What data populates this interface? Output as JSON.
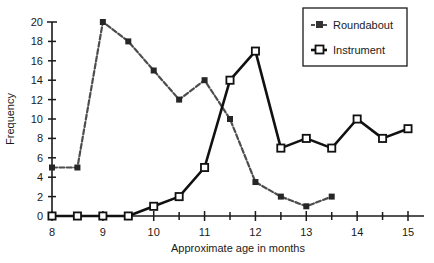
{
  "chart_data": {
    "type": "line",
    "title": "",
    "subtitle": "",
    "xlabel": "Approximate age in months",
    "ylabel": "Frequency",
    "xlim": [
      8,
      15
    ],
    "ylim": [
      0,
      20
    ],
    "x_tick_step": 1,
    "x_minor_tick_step": 0.5,
    "y_tick_step": 2,
    "grid": false,
    "legend_position": "top-right",
    "x_tick_labels": [
      "8",
      "9",
      "10",
      "11",
      "12",
      "13",
      "14",
      "15"
    ],
    "y_tick_labels": [
      "0",
      "2",
      "4",
      "6",
      "8",
      "10",
      "12",
      "14",
      "16",
      "18",
      "20"
    ],
    "x": [
      8,
      8.5,
      9,
      9.5,
      10,
      10.5,
      11,
      11.5,
      12,
      12.5,
      13,
      13.5,
      14,
      14.5,
      15
    ],
    "series": [
      {
        "name": "Roundabout",
        "marker": "filled-square",
        "color": "#4d4d4d",
        "x": [
          8,
          8.5,
          9,
          9.5,
          10,
          10.5,
          11,
          11.5,
          12,
          12.5,
          13,
          13.5
        ],
        "values": [
          5,
          5,
          20,
          18,
          15,
          12,
          14,
          10,
          3.5,
          2,
          1,
          2
        ]
      },
      {
        "name": "Instrument",
        "marker": "open-square",
        "color": "#111111",
        "x": [
          8,
          8.5,
          9,
          9.5,
          10,
          10.5,
          11,
          11.5,
          12,
          12.5,
          13,
          13.5,
          14,
          14.5,
          15
        ],
        "values": [
          0,
          0,
          0,
          0,
          1,
          2,
          5,
          14,
          17,
          7,
          8,
          7,
          10,
          8,
          9
        ]
      }
    ]
  },
  "legend": {
    "items": [
      {
        "label": "Roundabout",
        "marker": "filled-square"
      },
      {
        "label": "Instrument",
        "marker": "open-square"
      }
    ]
  },
  "axes": {
    "x_title": "Approximate age in months",
    "y_title": "Frequency"
  }
}
